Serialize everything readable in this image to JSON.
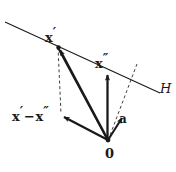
{
  "figure": {
    "background_color": "#ffffff",
    "stroke_color": "#1a1a1a",
    "width": 176,
    "height": 172
  },
  "labels": {
    "x_prime": "x",
    "x_prime_mark": "′",
    "x_double_prime": "x",
    "x_double_prime_mark": "″",
    "difference_minus": "−",
    "vector_a": "a",
    "origin": "0",
    "hyperplane": "H"
  },
  "geometry": {
    "hyperplane_line": {
      "name": "H",
      "start": [
        5,
        22
      ],
      "end": [
        160,
        93
      ],
      "style": "solid"
    },
    "normal_dashed_line": {
      "start": [
        137,
        64
      ],
      "end": [
        108,
        140
      ],
      "style": "dashed"
    },
    "projection_dashed_line": {
      "start": [
        58,
        47
      ],
      "end": [
        61,
        116
      ],
      "style": "dashed"
    },
    "origin_point": [
      108,
      140
    ],
    "x_prime_point": [
      58,
      47
    ],
    "x_double_prime_tip": [
      107,
      72
    ],
    "difference_tip": [
      61,
      116
    ],
    "a_tip": [
      124,
      115
    ],
    "vectors": [
      {
        "name": "x-prime-vector",
        "from": [
          108,
          140
        ],
        "to": [
          58,
          47
        ]
      },
      {
        "name": "x-double-prime-vector",
        "from": [
          108,
          140
        ],
        "to": [
          107,
          72
        ]
      },
      {
        "name": "difference-vector",
        "from": [
          108,
          140
        ],
        "to": [
          61,
          116
        ]
      },
      {
        "name": "a-vector",
        "from": [
          108,
          140
        ],
        "to": [
          124,
          115
        ]
      },
      {
        "name": "x-prime-to-origin-edge",
        "from": [
          58,
          47
        ],
        "to": [
          108,
          140
        ]
      }
    ]
  }
}
